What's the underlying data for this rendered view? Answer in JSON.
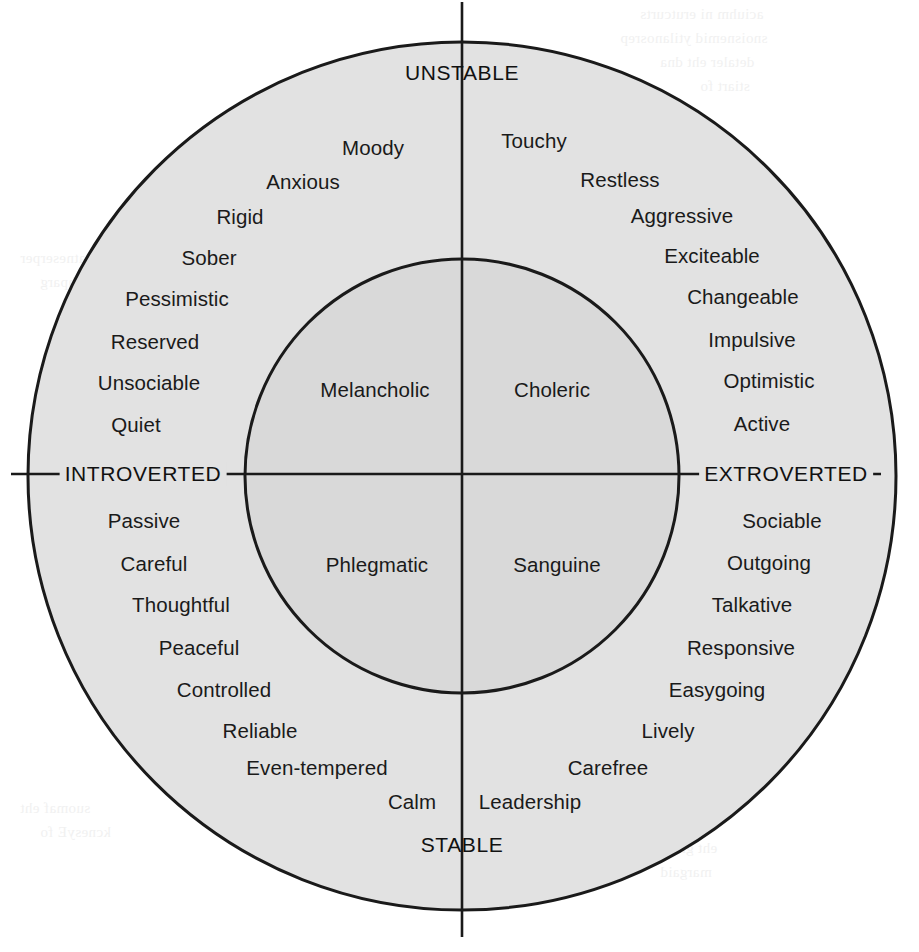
{
  "figure": {
    "axes": {
      "top": "UNSTABLE",
      "bottom": "STABLE",
      "left": "INTROVERTED",
      "right": "EXTROVERTED"
    },
    "colors": {
      "outer_ring_fill": "#e2e2e2",
      "inner_circle_fill": "#d9d9d9",
      "stroke": "#1a1a1a",
      "text": "#1a1a1a",
      "background": "#ffffff"
    },
    "temperaments": [
      {
        "name": "Melancholic",
        "quadrant": "unstable-introverted"
      },
      {
        "name": "Choleric",
        "quadrant": "unstable-extroverted"
      },
      {
        "name": "Phlegmatic",
        "quadrant": "stable-introverted"
      },
      {
        "name": "Sanguine",
        "quadrant": "stable-extroverted"
      }
    ],
    "quadrants": {
      "unstable_introverted": {
        "label": "Melancholic",
        "traits": [
          "Moody",
          "Anxious",
          "Rigid",
          "Sober",
          "Pessimistic",
          "Reserved",
          "Unsociable",
          "Quiet"
        ]
      },
      "unstable_extroverted": {
        "label": "Choleric",
        "traits": [
          "Touchy",
          "Restless",
          "Aggressive",
          "Exciteable",
          "Changeable",
          "Impulsive",
          "Optimistic",
          "Active"
        ]
      },
      "stable_introverted": {
        "label": "Phlegmatic",
        "traits": [
          "Passive",
          "Careful",
          "Thoughtful",
          "Peaceful",
          "Controlled",
          "Reliable",
          "Even-tempered",
          "Calm"
        ]
      },
      "stable_extroverted": {
        "label": "Sanguine",
        "traits": [
          "Sociable",
          "Outgoing",
          "Talkative",
          "Responsive",
          "Easygoing",
          "Lively",
          "Carefree",
          "Leadership"
        ]
      }
    }
  }
}
